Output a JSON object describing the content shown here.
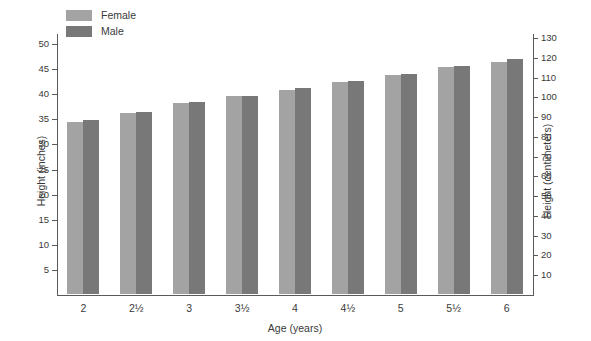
{
  "chart_data": {
    "type": "bar",
    "title": "",
    "xlabel": "Age (years)",
    "ylabel": "Height (inches)",
    "ylabel_secondary": "Height (centimeters)",
    "categories": [
      "2",
      "2½",
      "3",
      "3½",
      "4",
      "4½",
      "5",
      "5½",
      "6"
    ],
    "series": [
      {
        "name": "Female",
        "color": "#a3a3a3",
        "values": [
          34.2,
          36.1,
          38.0,
          39.5,
          40.7,
          42.3,
          43.7,
          45.2,
          46.3
        ]
      },
      {
        "name": "Male",
        "color": "#787878",
        "values": [
          34.6,
          36.3,
          38.2,
          39.4,
          41.0,
          42.4,
          43.8,
          45.5,
          46.8
        ]
      }
    ],
    "ylim": [
      0,
      52
    ],
    "yticks": [
      5,
      10,
      15,
      20,
      25,
      30,
      35,
      40,
      45,
      50
    ],
    "ytick_labels": [
      "5",
      "10",
      "15",
      "20",
      "25",
      "30",
      "35",
      "40",
      "45",
      "50"
    ],
    "ylim_secondary": [
      0,
      132.08
    ],
    "yticks_secondary": [
      10,
      20,
      30,
      40,
      50,
      60,
      70,
      80,
      90,
      100,
      110,
      120,
      130
    ],
    "ytick_labels_secondary": [
      "10",
      "20",
      "30",
      "40",
      "50",
      "60",
      "70",
      "80",
      "90",
      "100",
      "110",
      "120",
      "130"
    ],
    "grid": false,
    "legend_position": "top-left"
  },
  "legend": {
    "entries": [
      {
        "label": "Female",
        "color": "#a3a3a3"
      },
      {
        "label": "Male",
        "color": "#787878"
      }
    ]
  },
  "axes": {
    "x_title": "Age (years)",
    "y_left_title": "Height (inches)",
    "y_right_title": "Height (centimeters)"
  }
}
